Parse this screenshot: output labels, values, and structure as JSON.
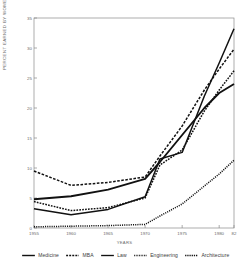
{
  "chart_data": {
    "type": "line",
    "title": "",
    "xlabel": "YEARS",
    "ylabel": "PERCENT EARNED BY WOMEN",
    "xlim": [
      1955,
      1982
    ],
    "ylim": [
      0,
      35
    ],
    "xticks": [
      1955,
      1960,
      1965,
      1970,
      1975,
      1980,
      1982
    ],
    "xticklabels": [
      "1955",
      "1960",
      "1965",
      "1970",
      "1975",
      "1980",
      "82"
    ],
    "yticks": [
      0,
      5,
      10,
      15,
      20,
      25,
      30,
      35
    ],
    "yticklabels": [
      "0",
      "5",
      "10",
      "15",
      "20",
      "25",
      "30",
      "35"
    ],
    "grid": false,
    "legend_position": "below",
    "series": [
      {
        "name": "Medicine",
        "style": "solid-thick",
        "x": [
          1955,
          1960,
          1965,
          1970,
          1972,
          1975,
          1978,
          1980,
          1982
        ],
        "values": [
          4.8,
          5.3,
          6.4,
          8.2,
          11.0,
          15.5,
          20.0,
          22.5,
          24.0
        ]
      },
      {
        "name": "MBA",
        "style": "dashed",
        "x": [
          1955,
          1960,
          1965,
          1970,
          1972,
          1975,
          1978,
          1980,
          1982
        ],
        "values": [
          9.5,
          7.1,
          7.6,
          8.5,
          12.0,
          17.0,
          23.0,
          26.5,
          29.8
        ]
      },
      {
        "name": "Law",
        "style": "solid",
        "x": [
          1955,
          1960,
          1965,
          1970,
          1972,
          1975,
          1978,
          1980,
          1982
        ],
        "values": [
          3.2,
          2.2,
          3.1,
          5.2,
          11.5,
          12.6,
          22.0,
          27.5,
          33.2
        ]
      },
      {
        "name": "Engineering",
        "style": "dotted",
        "x": [
          1955,
          1960,
          1965,
          1970,
          1972,
          1975,
          1978,
          1980,
          1982
        ],
        "values": [
          0.2,
          0.3,
          0.4,
          0.6,
          2.0,
          4.0,
          7.0,
          9.0,
          11.3
        ]
      },
      {
        "name": "Architecture",
        "style": "dash-dot",
        "x": [
          1955,
          1960,
          1965,
          1970,
          1972,
          1975,
          1978,
          1980,
          1982
        ],
        "values": [
          4.4,
          2.9,
          3.4,
          5.0,
          10.5,
          13.0,
          19.5,
          23.0,
          26.2
        ]
      }
    ]
  },
  "legend": {
    "items": [
      {
        "label": "Medicine"
      },
      {
        "label": "MBA"
      },
      {
        "label": "Law"
      },
      {
        "label": "Engineering"
      },
      {
        "label": "Architecture"
      }
    ]
  },
  "colors": {
    "line": "#111111",
    "axis": "#8a8a8a",
    "text": "#6b6b6b",
    "background": "#ffffff"
  }
}
